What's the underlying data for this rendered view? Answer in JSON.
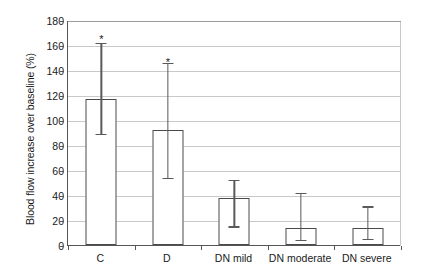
{
  "chart_data": {
    "type": "bar",
    "title": "",
    "xlabel": "",
    "ylabel": "Blood flow increase over baseline (%)",
    "categories": [
      "C",
      "D",
      "DN mild",
      "DN moderate",
      "DN severe"
    ],
    "values": [
      117,
      92,
      38,
      14,
      14
    ],
    "error_low": [
      89,
      54,
      15,
      4,
      5
    ],
    "error_high": [
      162,
      146,
      52,
      42,
      31
    ],
    "annotations": [
      "*",
      "*",
      "",
      "",
      ""
    ],
    "annotation_values": [
      168,
      150,
      null,
      null,
      null
    ],
    "ylim": [
      0,
      180
    ],
    "ytick_values": [
      0,
      20,
      40,
      60,
      80,
      100,
      120,
      140,
      160,
      180
    ],
    "ytick_labels": [
      "0",
      "20",
      "40",
      "60",
      "80",
      "100",
      "120",
      "140",
      "160",
      "180"
    ],
    "grid": true,
    "legend": "none",
    "bar_fill": "#ffffff",
    "bar_edge": "#4a4a4a",
    "grid_color": "#c9c9c9",
    "axis_color": "#555555"
  }
}
